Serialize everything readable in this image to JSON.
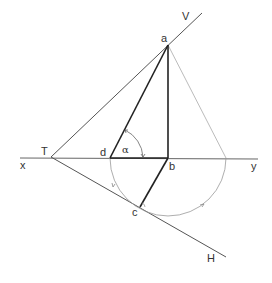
{
  "diagram": {
    "type": "descriptive-geometry",
    "labels": {
      "a": "a",
      "b": "b",
      "c": "c",
      "d": "d",
      "T": "T",
      "V": "V",
      "H": "H",
      "x": "x",
      "y": "y",
      "alpha": "α"
    },
    "points": {
      "T": [
        51,
        157
      ],
      "a": [
        168,
        45
      ],
      "b": [
        168,
        158
      ],
      "c": [
        140,
        207
      ],
      "d": [
        110,
        158
      ],
      "y_arc_end": [
        226,
        158
      ]
    },
    "lines": {
      "ground_line": {
        "from": [
          20,
          158
        ],
        "to": [
          258,
          159
        ],
        "label_left": "x",
        "label_right": "y"
      },
      "vertical_trace": {
        "from": [
          51,
          157
        ],
        "to": [
          202,
          13
        ],
        "label": "V"
      },
      "horizontal_trace": {
        "from": [
          51,
          157
        ],
        "to": [
          226,
          257
        ],
        "label": "H"
      },
      "a_b": {
        "from": [
          168,
          45
        ],
        "to": [
          168,
          158
        ]
      },
      "a_d": {
        "from": [
          168,
          45
        ],
        "to": [
          110,
          158
        ]
      },
      "d_b": {
        "from": [
          110,
          158
        ],
        "to": [
          168,
          158
        ]
      },
      "b_c": {
        "from": [
          168,
          158
        ],
        "to": [
          140,
          207
        ]
      },
      "a_arc_end": {
        "from": [
          168,
          45
        ],
        "to": [
          226,
          158
        ]
      }
    },
    "arc": {
      "center": [
        168,
        158
      ],
      "radius": 58
    },
    "colors": {
      "thick_line": "#222222",
      "thin_line": "#555555",
      "construction": "#999999"
    }
  }
}
